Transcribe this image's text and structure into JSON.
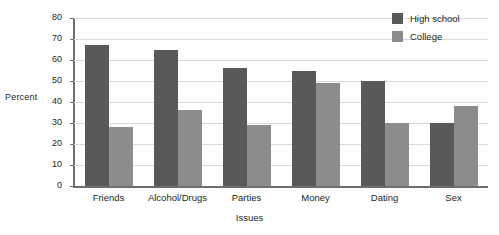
{
  "chart_data": {
    "type": "bar",
    "title": "",
    "xlabel": "Issues",
    "ylabel": "Percent",
    "categories": [
      "Friends",
      "Alcohol/Drugs",
      "Parties",
      "Money",
      "Dating",
      "Sex"
    ],
    "series": [
      {
        "name": "High school",
        "color": "#58595b",
        "values": [
          67,
          65,
          56,
          55,
          50,
          30
        ]
      },
      {
        "name": "College",
        "color": "#8a8c8e",
        "values": [
          28,
          36,
          29,
          49,
          30,
          38
        ]
      }
    ],
    "ylim": [
      0,
      80
    ],
    "ytick_step": 10,
    "yticks": [
      0,
      10,
      20,
      30,
      40,
      50,
      60,
      70,
      80
    ],
    "ytick_labels": [
      "0",
      "10",
      "20",
      "30",
      "40",
      "50",
      "60",
      "70",
      "80"
    ],
    "grid": true,
    "legend_position": "top-right",
    "legend": [
      "High school",
      "College"
    ]
  }
}
